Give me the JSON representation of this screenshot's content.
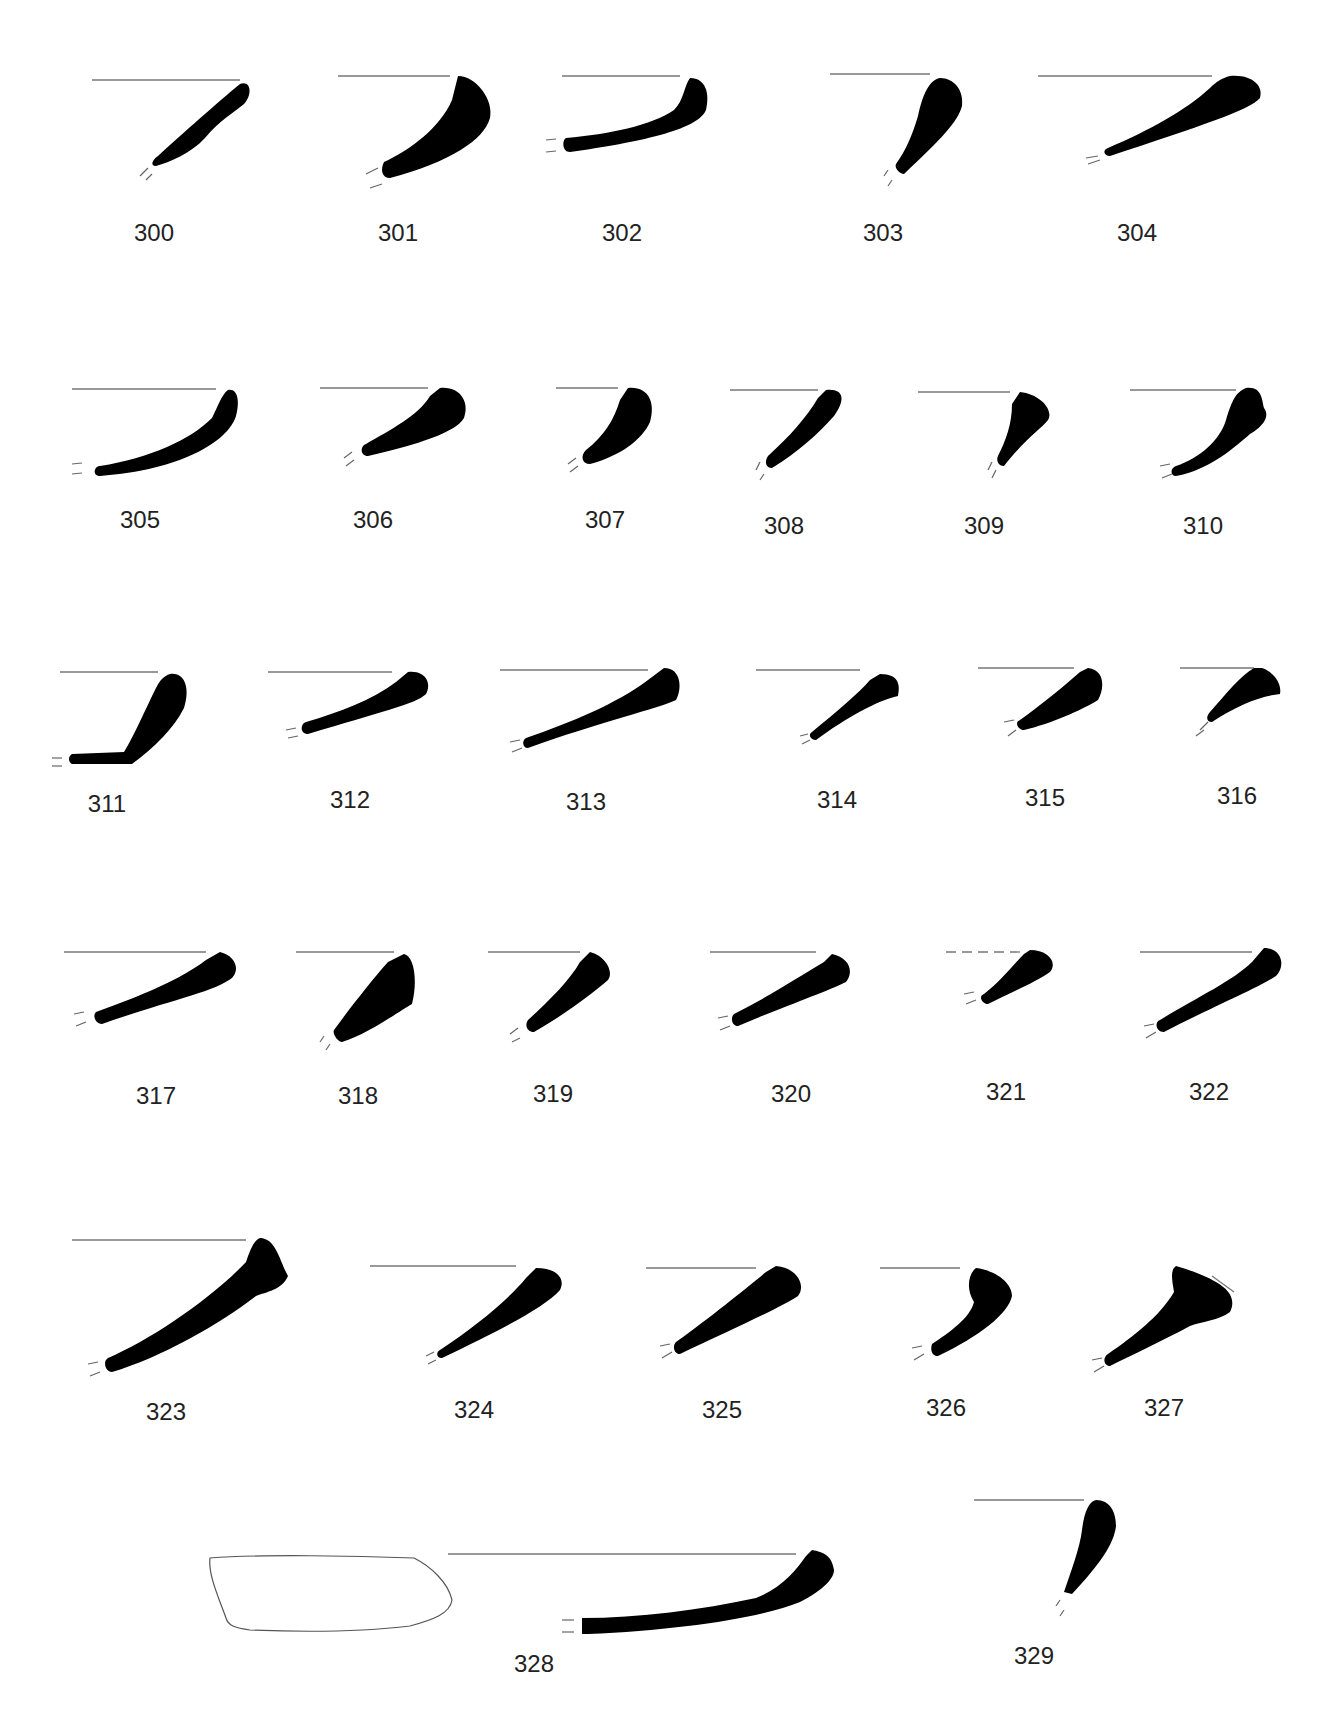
{
  "plate": {
    "type": "pottery rim profiles",
    "items": [
      {
        "id": "300",
        "label": "300",
        "lx": 154,
        "ly": 233,
        "rim": [
          92,
          80,
          240,
          80
        ],
        "path": "M240,84 C252,80 252,96 244,104 C232,114 220,120 205,138 C190,154 170,162 156,166 C150,166 152,160 158,156 C182,134 218,102 240,84 Z",
        "brk": [
          [
            148,
            168,
            140,
            176
          ],
          [
            152,
            174,
            146,
            180
          ]
        ]
      },
      {
        "id": "301",
        "label": "301",
        "lx": 398,
        "ly": 233,
        "rim": [
          338,
          76,
          450,
          76
        ],
        "path": "M458,76 C476,76 494,100 490,118 C484,140 450,162 390,178 C382,178 380,170 384,162 C410,150 440,128 452,100 Z",
        "brk": [
          [
            378,
            168,
            366,
            174
          ],
          [
            382,
            184,
            370,
            188
          ]
        ]
      },
      {
        "id": "302",
        "label": "302",
        "lx": 622,
        "ly": 233,
        "rim": [
          562,
          76,
          680,
          76
        ],
        "path": "M690,78 C706,78 710,94 706,110 C700,124 670,138 570,152 C562,152 562,140 566,138 C610,134 650,126 674,110 C684,100 684,86 690,78 Z",
        "brk": [
          [
            546,
            140,
            556,
            139
          ],
          [
            546,
            152,
            556,
            151
          ]
        ]
      },
      {
        "id": "303",
        "label": "303",
        "lx": 883,
        "ly": 233,
        "rim": [
          830,
          74,
          930,
          74
        ],
        "path": "M940,78 C954,78 964,90 962,106 C958,122 940,140 904,174 C900,174 894,168 896,164 C906,150 912,136 918,116 C922,98 928,80 940,78 Z",
        "brk": [
          [
            888,
            170,
            884,
            176
          ],
          [
            892,
            180,
            888,
            186
          ]
        ]
      },
      {
        "id": "304",
        "label": "304",
        "lx": 1137,
        "ly": 233,
        "rim": [
          1038,
          76,
          1212,
          76
        ],
        "path": "M1230,76 C1252,74 1264,86 1260,98 C1250,110 1200,126 1110,156 C1104,156 1102,150 1108,148 C1150,130 1186,110 1210,88 C1216,82 1222,78 1230,76 Z",
        "brk": [
          [
            1086,
            158,
            1098,
            156
          ],
          [
            1088,
            164,
            1100,
            160
          ]
        ]
      },
      {
        "id": "305",
        "label": "305",
        "lx": 140,
        "ly": 520,
        "rim": [
          72,
          389,
          216,
          389
        ],
        "path": "M228,390 C238,388 240,402 236,416 C228,442 180,470 100,476 C92,476 94,466 100,466 C150,458 190,440 212,418 C218,406 222,394 228,390 Z",
        "brk": [
          [
            72,
            464,
            82,
            463
          ],
          [
            72,
            474,
            82,
            473
          ]
        ]
      },
      {
        "id": "306",
        "label": "306",
        "lx": 373,
        "ly": 520,
        "rim": [
          320,
          388,
          428,
          388
        ],
        "path": "M440,388 C460,386 470,402 464,418 C456,432 420,444 368,456 C360,456 360,446 366,444 C390,430 418,416 430,396 Z",
        "brk": [
          [
            352,
            452,
            344,
            458
          ],
          [
            354,
            460,
            346,
            466
          ]
        ]
      },
      {
        "id": "307",
        "label": "307",
        "lx": 605,
        "ly": 520,
        "rim": [
          556,
          388,
          618,
          388
        ],
        "path": "M628,388 C648,386 656,402 650,422 C642,440 620,456 590,464 C582,464 580,456 586,450 C604,436 614,420 620,400 Z",
        "brk": [
          [
            576,
            458,
            568,
            464
          ],
          [
            578,
            466,
            570,
            472
          ]
        ]
      },
      {
        "id": "308",
        "label": "308",
        "lx": 784,
        "ly": 526,
        "rim": [
          730,
          390,
          818,
          390
        ],
        "path": "M826,390 C844,388 846,400 834,416 C818,434 798,452 772,468 C766,468 764,462 768,456 C790,436 806,418 818,398 Z",
        "brk": [
          [
            760,
            462,
            756,
            470
          ],
          [
            764,
            474,
            760,
            480
          ]
        ]
      },
      {
        "id": "309",
        "label": "309",
        "lx": 984,
        "ly": 526,
        "rim": [
          918,
          392,
          1010,
          392
        ],
        "path": "M1020,392 C1040,394 1054,410 1048,420 C1040,430 1026,438 1004,466 C998,466 996,460 998,456 C1006,440 1012,424 1012,404 Z",
        "brk": [
          [
            992,
            462,
            988,
            470
          ],
          [
            996,
            470,
            992,
            478
          ]
        ]
      },
      {
        "id": "310",
        "label": "310",
        "lx": 1203,
        "ly": 526,
        "rim": [
          1130,
          390,
          1236,
          390
        ],
        "path": "M1246,388 C1262,386 1262,400 1264,408 C1270,416 1264,426 1250,434 C1236,446 1210,470 1176,476 C1170,476 1170,468 1176,466 C1200,458 1220,440 1226,420 C1232,400 1236,392 1246,388 Z",
        "brk": [
          [
            1160,
            466,
            1170,
            464
          ],
          [
            1162,
            478,
            1172,
            474
          ]
        ]
      },
      {
        "id": "311",
        "label": "311",
        "lx": 107,
        "ly": 804,
        "rim": [
          60,
          672,
          158,
          672
        ],
        "path": "M170,674 C186,672 190,690 184,708 C174,728 154,748 132,764 L72,764 C68,762 68,756 72,754 L124,752 C134,736 146,708 156,688 C160,680 164,676 170,674 Z",
        "brk": [
          [
            52,
            758,
            62,
            758
          ],
          [
            52,
            766,
            62,
            766
          ]
        ]
      },
      {
        "id": "312",
        "label": "312",
        "lx": 350,
        "ly": 800,
        "rim": [
          268,
          672,
          392,
          672
        ],
        "path": "M408,672 C426,670 432,684 426,694 C416,704 380,712 308,734 C300,734 300,724 306,722 C340,712 372,700 396,682 Z",
        "brk": [
          [
            286,
            730,
            296,
            728
          ],
          [
            288,
            738,
            298,
            736
          ]
        ]
      },
      {
        "id": "313",
        "label": "313",
        "lx": 586,
        "ly": 802,
        "rim": [
          500,
          670,
          648,
          670
        ],
        "path": "M664,668 C682,668 682,690 676,700 C660,708 600,722 528,748 C522,748 522,740 526,738 C572,722 616,704 648,680 Z",
        "brk": [
          [
            510,
            742,
            520,
            740
          ],
          [
            512,
            752,
            522,
            748
          ]
        ]
      },
      {
        "id": "314",
        "label": "314",
        "lx": 837,
        "ly": 800,
        "rim": [
          756,
          670,
          860,
          670
        ],
        "path": "M880,674 C900,674 900,686 898,696 C878,700 846,718 816,740 C810,740 808,734 812,732 C836,712 858,694 870,680 Z",
        "brk": [
          [
            800,
            736,
            808,
            734
          ],
          [
            802,
            744,
            810,
            740
          ]
        ]
      },
      {
        "id": "315",
        "label": "315",
        "lx": 1045,
        "ly": 798,
        "rim": [
          978,
          668,
          1074,
          668
        ],
        "path": "M1088,668 C1106,670 1104,690 1098,700 C1082,710 1050,724 1024,730 C1018,730 1014,722 1020,720 C1040,706 1064,686 1080,672 Z",
        "brk": [
          [
            1004,
            722,
            1014,
            720
          ],
          [
            1008,
            736,
            1016,
            730
          ]
        ]
      },
      {
        "id": "316",
        "label": "316",
        "lx": 1237,
        "ly": 796,
        "rim": [
          1180,
          668,
          1254,
          668
        ],
        "path": "M1262,668 C1274,672 1282,684 1280,694 C1260,696 1236,706 1212,722 C1206,722 1206,716 1210,712 C1226,694 1240,676 1254,668 Z",
        "brk": [
          [
            1200,
            730,
            1208,
            722
          ],
          [
            1196,
            736,
            1204,
            730
          ]
        ]
      },
      {
        "id": "317",
        "label": "317",
        "lx": 156,
        "ly": 1096,
        "rim": [
          64,
          952,
          206,
          952
        ],
        "path": "M220,952 C236,956 240,970 232,978 C214,992 170,1000 102,1024 C96,1024 92,1016 96,1012 C140,996 180,980 206,960 Z",
        "brk": [
          [
            74,
            1014,
            84,
            1012
          ],
          [
            76,
            1026,
            86,
            1022
          ]
        ]
      },
      {
        "id": "318",
        "label": "318",
        "lx": 358,
        "ly": 1096,
        "rim": [
          296,
          952,
          394,
          952
        ],
        "path": "M404,954 C414,956 418,980 412,1004 C398,1012 368,1034 342,1042 C338,1042 332,1034 334,1030 C350,1008 372,980 388,962 Z",
        "brk": [
          [
            324,
            1036,
            320,
            1042
          ],
          [
            330,
            1044,
            326,
            1050
          ]
        ]
      },
      {
        "id": "319",
        "label": "319",
        "lx": 553,
        "ly": 1094,
        "rim": [
          488,
          952,
          580,
          952
        ],
        "path": "M590,952 C606,956 614,972 608,980 C594,992 566,1014 534,1032 C528,1032 524,1026 528,1020 C548,1002 570,980 580,962 Z",
        "brk": [
          [
            518,
            1028,
            510,
            1034
          ],
          [
            520,
            1038,
            512,
            1042
          ]
        ]
      },
      {
        "id": "320",
        "label": "320",
        "lx": 791,
        "ly": 1094,
        "rim": [
          710,
          952,
          816,
          952
        ],
        "path": "M832,954 C850,958 854,972 846,982 C826,992 780,1008 738,1026 C732,1026 730,1018 734,1014 C770,996 800,976 824,962 Z",
        "brk": [
          [
            718,
            1018,
            728,
            1016
          ],
          [
            720,
            1030,
            730,
            1026
          ]
        ]
      },
      {
        "id": "321",
        "label": "321",
        "lx": 1006,
        "ly": 1092,
        "rim": [
          946,
          952,
          1020,
          952
        ],
        "path": "M1030,950 C1048,950 1058,962 1050,972 C1036,982 1012,992 988,1004 C982,1004 978,996 984,994 C1000,982 1014,964 1024,954 Z",
        "brk": [
          [
            964,
            994,
            974,
            992
          ],
          [
            966,
            1004,
            976,
            1000
          ]
        ],
        "rim_dashed": true
      },
      {
        "id": "322",
        "label": "322",
        "lx": 1209,
        "ly": 1092,
        "rim": [
          1140,
          952,
          1252,
          952
        ],
        "path": "M1264,948 C1282,948 1286,966 1276,976 C1258,988 1210,1008 1164,1032 C1156,1032 1154,1022 1160,1020 C1196,998 1234,980 1252,962 Z",
        "brk": [
          [
            1144,
            1026,
            1154,
            1024
          ],
          [
            1146,
            1038,
            1156,
            1032
          ]
        ]
      },
      {
        "id": "323",
        "label": "323",
        "lx": 166,
        "ly": 1412,
        "rim": [
          72,
          1240,
          246,
          1240
        ],
        "path": "M260,1238 C276,1238 280,1262 288,1276 C282,1290 266,1292 256,1296 C220,1324 160,1358 112,1372 C106,1372 102,1362 108,1358 C150,1340 210,1300 246,1262 C250,1250 254,1240 260,1238 Z",
        "brk": [
          [
            88,
            1364,
            98,
            1362
          ],
          [
            90,
            1376,
            100,
            1372
          ]
        ]
      },
      {
        "id": "324",
        "label": "324",
        "lx": 474,
        "ly": 1410,
        "rim": [
          370,
          1266,
          516,
          1266
        ],
        "path": "M536,1268 C556,1268 566,1278 560,1290 C544,1308 500,1330 442,1358 C436,1358 436,1352 440,1350 C476,1326 508,1300 526,1278 Z",
        "brk": [
          [
            426,
            1356,
            434,
            1352
          ],
          [
            428,
            1364,
            436,
            1360
          ]
        ]
      },
      {
        "id": "325",
        "label": "325",
        "lx": 722,
        "ly": 1410,
        "rim": [
          646,
          1268,
          756,
          1268
        ],
        "path": "M776,1266 C798,1268 806,1286 798,1296 C780,1308 730,1330 680,1354 C674,1354 672,1346 676,1342 C712,1316 744,1290 766,1272 Z",
        "brk": [
          [
            660,
            1346,
            670,
            1344
          ],
          [
            662,
            1358,
            672,
            1352
          ]
        ]
      },
      {
        "id": "326",
        "label": "326",
        "lx": 946,
        "ly": 1408,
        "rim": [
          880,
          1268,
          960,
          1268
        ],
        "path": "M976,1268 C994,1270 1012,1282 1012,1296 C1008,1314 980,1336 938,1356 C932,1356 930,1350 932,1344 C950,1332 970,1318 974,1302 C966,1290 968,1274 976,1268 Z",
        "brk": [
          [
            912,
            1348,
            922,
            1346
          ],
          [
            914,
            1360,
            924,
            1354
          ]
        ]
      },
      {
        "id": "327",
        "label": "327",
        "lx": 1164,
        "ly": 1408,
        "rim": [
          1212,
          1276,
          1234,
          1292
        ],
        "path": "M1176,1266 C1190,1270 1206,1276 1216,1282 C1230,1290 1236,1300 1230,1312 C1220,1320 1200,1322 1190,1326 C1160,1342 1130,1356 1110,1366 C1104,1366 1102,1358 1108,1354 C1134,1336 1160,1316 1174,1292 C1172,1280 1170,1270 1176,1266 Z M1202,1286 C1210,1292 1216,1300 1218,1306 C1212,1308 1206,1306 1202,1300 Z",
        "brk": [
          [
            1092,
            1360,
            1102,
            1358
          ],
          [
            1094,
            1372,
            1104,
            1366
          ]
        ]
      },
      {
        "id": "328",
        "label": "328",
        "lx": 534,
        "ly": 1664,
        "rim": [
          448,
          1554,
          796,
          1554
        ],
        "path": "M812,1550 C824,1552 832,1556 834,1570 C834,1578 824,1590 800,1602 C760,1618 680,1630 588,1634 L582,1634 L582,1618 C640,1618 700,1610 756,1598 C782,1588 796,1570 806,1556 Z",
        "brk": [
          [
            562,
            1620,
            574,
            1620
          ],
          [
            562,
            1632,
            574,
            1632
          ]
        ]
      },
      {
        "id": "329",
        "label": "329",
        "lx": 1034,
        "ly": 1656,
        "rim": [
          974,
          1500,
          1084,
          1500
        ],
        "path": "M1096,1500 C1110,1500 1116,1512 1116,1526 C1114,1544 1100,1564 1072,1594 L1064,1592 C1070,1574 1080,1548 1082,1530 C1084,1514 1088,1502 1096,1500 Z",
        "brk": [
          [
            1060,
            1600,
            1056,
            1606
          ],
          [
            1064,
            1610,
            1060,
            1616
          ]
        ]
      }
    ],
    "outline_328": "M210,1558 C260,1554 360,1556 414,1558 C430,1566 448,1582 452,1600 C450,1614 432,1620 410,1626 C360,1632 300,1632 250,1630 C236,1628 228,1626 226,1618 C218,1596 208,1574 210,1558 Z"
  }
}
